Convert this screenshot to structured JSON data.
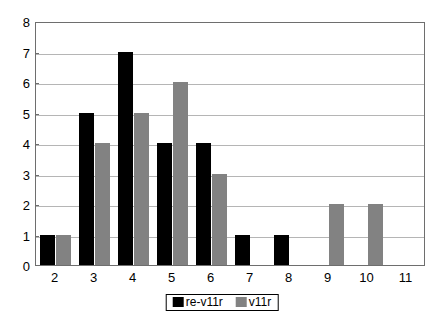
{
  "chart_data": {
    "type": "bar",
    "title": "",
    "subtitle": "",
    "xlabel": "",
    "ylabel": "",
    "categories": [
      "2",
      "3",
      "4",
      "5",
      "6",
      "7",
      "8",
      "9",
      "10",
      "11"
    ],
    "series": [
      {
        "name": "re-v11r",
        "color": "#000000",
        "values": [
          1,
          5,
          7,
          4,
          4,
          1,
          1,
          0,
          0,
          0
        ]
      },
      {
        "name": "v11r",
        "color": "#828282",
        "values": [
          1,
          4,
          5,
          6,
          3,
          0,
          0,
          2,
          2,
          0
        ]
      }
    ],
    "ylim": [
      0,
      8
    ],
    "ytick_step": 1,
    "yticks": [
      "0",
      "1",
      "2",
      "3",
      "4",
      "5",
      "6",
      "7",
      "8"
    ],
    "grid": true,
    "grid_axis": "y",
    "grid_color": "#b5b5b5",
    "legend_position": "bottom-center",
    "legend_border": true,
    "plot_border_color": "#6e6e6e",
    "background_color": "#ffffff"
  }
}
